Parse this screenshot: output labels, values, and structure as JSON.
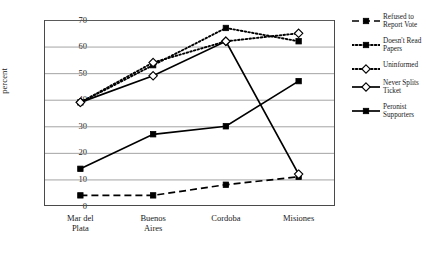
{
  "chart_data": {
    "type": "line",
    "title": "",
    "xlabel": "",
    "ylabel": "percent",
    "categories": [
      "Mar del Plata",
      "Buenos Aires",
      "Cordoba",
      "Misiones"
    ],
    "category_lines": [
      [
        "Mar del",
        "Plata"
      ],
      [
        "Buenos",
        "Aires"
      ],
      [
        "Cordoba",
        ""
      ],
      [
        "Misiones",
        ""
      ]
    ],
    "ylim": [
      0,
      70
    ],
    "yticks": [
      0,
      10,
      20,
      30,
      40,
      50,
      60,
      70
    ],
    "grid": "horizontal",
    "legend_position": "right",
    "series": [
      {
        "name": "Refused to Report Vote",
        "label_lines": [
          "Refused to",
          "Report Vote"
        ],
        "values": [
          4,
          4,
          8,
          11
        ],
        "line_style": "dashed",
        "marker": "filled-square",
        "color": "#000000"
      },
      {
        "name": "Doesn't Read Papers",
        "label_lines": [
          "Doesn't Read",
          "Papers"
        ],
        "values": [
          39,
          53,
          67,
          62
        ],
        "line_style": "dotted",
        "marker": "filled-square",
        "color": "#000000"
      },
      {
        "name": "Uninformed",
        "label_lines": [
          "Uninformed",
          ""
        ],
        "values": [
          39,
          54,
          62,
          65
        ],
        "line_style": "dotted",
        "marker": "open-diamond",
        "color": "#000000"
      },
      {
        "name": "Never Splits Ticket",
        "label_lines": [
          "Never Splits",
          "Ticket"
        ],
        "values": [
          39,
          49,
          62,
          12
        ],
        "line_style": "solid",
        "marker": "open-diamond",
        "color": "#000000"
      },
      {
        "name": "Peronist Supporters",
        "label_lines": [
          "Peronist",
          "Supporters"
        ],
        "values": [
          14,
          27,
          30,
          47
        ],
        "line_style": "solid",
        "marker": "filled-square",
        "color": "#000000"
      }
    ]
  }
}
